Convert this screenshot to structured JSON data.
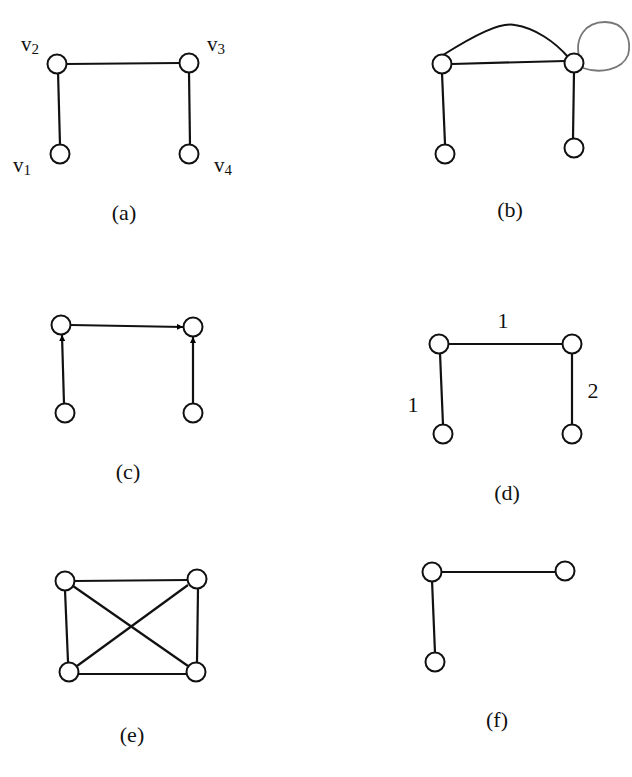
{
  "figure": {
    "panels": [
      {
        "id": "a",
        "caption": "(a)",
        "directed": false,
        "vertex_labels": [
          {
            "base": "v",
            "sub": "2",
            "vertex": "v2"
          },
          {
            "base": "v",
            "sub": "3",
            "vertex": "v3"
          },
          {
            "base": "v",
            "sub": "1",
            "vertex": "v1"
          },
          {
            "base": "v",
            "sub": "4",
            "vertex": "v4"
          }
        ],
        "edges": [
          [
            "v1",
            "v2"
          ],
          [
            "v2",
            "v3"
          ],
          [
            "v3",
            "v4"
          ]
        ]
      },
      {
        "id": "b",
        "caption": "(b)",
        "directed": false,
        "edges": [
          [
            "v1",
            "v2"
          ],
          [
            "v2",
            "v3"
          ],
          [
            "v2",
            "v3"
          ],
          [
            "v3",
            "v4"
          ],
          [
            "v3",
            "v3"
          ]
        ],
        "notes": "multigraph: parallel curved edge between v2 and v3, self-loop on v3"
      },
      {
        "id": "c",
        "caption": "(c)",
        "directed": true,
        "edges": [
          [
            "v1",
            "v2"
          ],
          [
            "v2",
            "v3"
          ],
          [
            "v4",
            "v3"
          ]
        ]
      },
      {
        "id": "d",
        "caption": "(d)",
        "directed": false,
        "weighted": true,
        "edges": [
          {
            "from": "v1",
            "to": "v2",
            "weight": "1"
          },
          {
            "from": "v2",
            "to": "v3",
            "weight": "1"
          },
          {
            "from": "v3",
            "to": "v4",
            "weight": "2"
          }
        ]
      },
      {
        "id": "e",
        "caption": "(e)",
        "directed": false,
        "edges": [
          [
            "v1",
            "v2"
          ],
          [
            "v2",
            "v3"
          ],
          [
            "v3",
            "v4"
          ],
          [
            "v1",
            "v4"
          ],
          [
            "v1",
            "v3"
          ],
          [
            "v2",
            "v4"
          ]
        ],
        "notes": "complete graph K4"
      },
      {
        "id": "f",
        "caption": "(f)",
        "directed": false,
        "edges": [
          [
            "v1",
            "v2"
          ],
          [
            "v2",
            "v3"
          ]
        ],
        "notes": "three vertices, path"
      }
    ]
  }
}
